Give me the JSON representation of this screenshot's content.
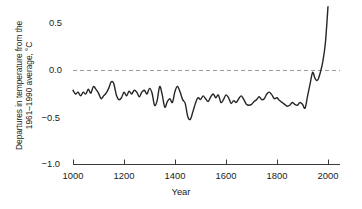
{
  "chart_data": {
    "type": "line",
    "title": "",
    "xlabel": "Year",
    "ylabel": "Departures in temperature from the 1961–1990 average, °C",
    "ylabel_line1": "Departures in temperature from the",
    "ylabel_line2": "1961–1990 average, °C",
    "xlim": [
      1000,
      2000
    ],
    "ylim": [
      -1.0,
      0.75
    ],
    "xticks": [
      1000,
      1200,
      1400,
      1600,
      1800,
      2000
    ],
    "xtick_labels": [
      "1000",
      "1200",
      "1400",
      "1600",
      "1800",
      "2000"
    ],
    "yticks": [
      0.5,
      0.0,
      -0.5,
      -1.0
    ],
    "ytick_labels": [
      "0.5",
      "0.0",
      "−0.5",
      "−1.0"
    ],
    "grid": false,
    "legend": null,
    "reference_lines": [
      {
        "name": "zero-baseline",
        "y": 0.0,
        "style": "dashed",
        "color": "#9a9a9a"
      }
    ],
    "series": [
      {
        "name": "Northern Hemisphere temperature anomaly reconstruction",
        "color": "#262626",
        "line_width": 1.4,
        "x": [
          1000,
          1010,
          1020,
          1030,
          1040,
          1050,
          1060,
          1070,
          1080,
          1090,
          1100,
          1110,
          1120,
          1130,
          1140,
          1150,
          1160,
          1170,
          1180,
          1190,
          1200,
          1210,
          1220,
          1230,
          1240,
          1250,
          1260,
          1270,
          1280,
          1290,
          1300,
          1310,
          1320,
          1330,
          1340,
          1350,
          1360,
          1370,
          1380,
          1390,
          1400,
          1410,
          1420,
          1430,
          1440,
          1450,
          1460,
          1470,
          1480,
          1490,
          1500,
          1510,
          1520,
          1530,
          1540,
          1550,
          1560,
          1570,
          1580,
          1590,
          1600,
          1610,
          1620,
          1630,
          1640,
          1650,
          1660,
          1670,
          1680,
          1690,
          1700,
          1710,
          1720,
          1730,
          1740,
          1750,
          1760,
          1770,
          1780,
          1790,
          1800,
          1810,
          1820,
          1830,
          1840,
          1850,
          1860,
          1870,
          1880,
          1890,
          1900,
          1910,
          1920,
          1930,
          1940,
          1950,
          1960,
          1970,
          1980,
          1990,
          2000
        ],
        "y": [
          -0.21,
          -0.25,
          -0.23,
          -0.27,
          -0.23,
          -0.25,
          -0.2,
          -0.24,
          -0.17,
          -0.2,
          -0.24,
          -0.3,
          -0.27,
          -0.24,
          -0.19,
          -0.12,
          -0.14,
          -0.26,
          -0.31,
          -0.29,
          -0.23,
          -0.27,
          -0.22,
          -0.25,
          -0.21,
          -0.23,
          -0.28,
          -0.23,
          -0.21,
          -0.25,
          -0.19,
          -0.24,
          -0.37,
          -0.32,
          -0.17,
          -0.26,
          -0.39,
          -0.33,
          -0.3,
          -0.34,
          -0.22,
          -0.17,
          -0.23,
          -0.31,
          -0.35,
          -0.49,
          -0.52,
          -0.44,
          -0.35,
          -0.29,
          -0.31,
          -0.27,
          -0.3,
          -0.33,
          -0.28,
          -0.25,
          -0.29,
          -0.26,
          -0.34,
          -0.31,
          -0.26,
          -0.29,
          -0.35,
          -0.32,
          -0.34,
          -0.3,
          -0.27,
          -0.31,
          -0.36,
          -0.37,
          -0.36,
          -0.33,
          -0.31,
          -0.28,
          -0.31,
          -0.3,
          -0.25,
          -0.23,
          -0.26,
          -0.3,
          -0.29,
          -0.32,
          -0.34,
          -0.36,
          -0.38,
          -0.37,
          -0.34,
          -0.36,
          -0.37,
          -0.34,
          -0.36,
          -0.4,
          -0.27,
          -0.14,
          -0.02,
          -0.09,
          -0.1,
          -0.02,
          0.1,
          0.3,
          0.68
        ]
      }
    ],
    "annotations": []
  },
  "axes": {
    "x_axis_line_color": "#3a3a3a",
    "y_axis_visible": false
  }
}
